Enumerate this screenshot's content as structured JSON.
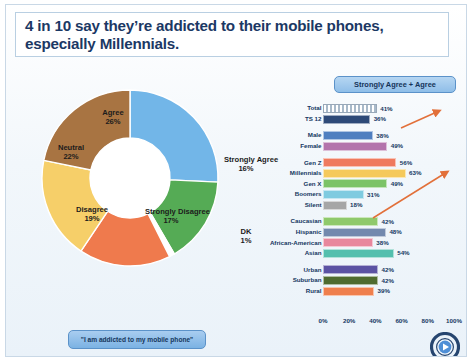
{
  "slide": {
    "title": "4 in 10 say they’re addicted to their mobile phones, especially Millennials.",
    "quote_caption": "\"I am addicted to my mobile phone\"",
    "legend_label": "Strongly Agree + Agree",
    "logo_name": "circular-play-button-logo"
  },
  "chart_data": [
    {
      "type": "pie",
      "title": "\"I am addicted to my mobile phone\"",
      "subtype": "donut",
      "labels": [
        "Agree",
        "Strongly Agree",
        "DK",
        "Strongly Disagree",
        "Disagree",
        "Neutral"
      ],
      "values": [
        26,
        16,
        1,
        17,
        19,
        22
      ],
      "value_labels": [
        "26%",
        "16%",
        "1%",
        "17%",
        "19%",
        "22%"
      ],
      "colors": [
        "#72b6e8",
        "#55ab55",
        "#ffffff",
        "#ef7a4d",
        "#f6cf69",
        "#a87442"
      ],
      "legend": "none"
    },
    {
      "type": "bar",
      "orientation": "horizontal",
      "title": "Strongly Agree + Agree",
      "xlabel": "",
      "ylabel": "",
      "xlim": [
        0,
        100
      ],
      "xticks": [
        "0%",
        "20%",
        "40%",
        "60%",
        "80%",
        "100%"
      ],
      "xtick_values": [
        0,
        20,
        40,
        60,
        80,
        100
      ],
      "grid": false,
      "groups": [
        {
          "rows": [
            {
              "label": "Total",
              "value": 41,
              "value_label": "41%",
              "color": "#cfd9e3",
              "pattern": "hatched"
            },
            {
              "label": "TS 12",
              "value": 36,
              "value_label": "36%",
              "color": "#2e4a78",
              "pattern": "solid"
            }
          ]
        },
        {
          "rows": [
            {
              "label": "Male",
              "value": 38,
              "value_label": "38%",
              "color": "#4f7fc0",
              "pattern": "solid"
            },
            {
              "label": "Female",
              "value": 49,
              "value_label": "49%",
              "color": "#b374ac",
              "pattern": "solid"
            }
          ]
        },
        {
          "rows": [
            {
              "label": "Gen Z",
              "value": 56,
              "value_label": "56%",
              "color": "#ef7a5e",
              "pattern": "solid"
            },
            {
              "label": "Millennials",
              "value": 63,
              "value_label": "63%",
              "color": "#f5c95b",
              "pattern": "solid"
            },
            {
              "label": "Gen X",
              "value": 49,
              "value_label": "49%",
              "color": "#7cc367",
              "pattern": "solid"
            },
            {
              "label": "Boomers",
              "value": 31,
              "value_label": "31%",
              "color": "#7fcbe0",
              "pattern": "solid"
            },
            {
              "label": "Silent",
              "value": 18,
              "value_label": "18%",
              "color": "#a6a6a6",
              "pattern": "solid"
            }
          ]
        },
        {
          "rows": [
            {
              "label": "Caucasian",
              "value": 42,
              "value_label": "42%",
              "color": "#8fc96b",
              "pattern": "solid"
            },
            {
              "label": "Hispanic",
              "value": 48,
              "value_label": "48%",
              "color": "#7389ae",
              "pattern": "solid"
            },
            {
              "label": "African-American",
              "value": 38,
              "value_label": "38%",
              "color": "#e8879d",
              "pattern": "solid"
            },
            {
              "label": "Asian",
              "value": 54,
              "value_label": "54%",
              "color": "#54bfae",
              "pattern": "solid"
            }
          ]
        },
        {
          "rows": [
            {
              "label": "Urban",
              "value": 42,
              "value_label": "42%",
              "color": "#5b52a3",
              "pattern": "solid"
            },
            {
              "label": "Suburban",
              "value": 42,
              "value_label": "42%",
              "color": "#4f6b2f",
              "pattern": "solid"
            },
            {
              "label": "Rural",
              "value": 39,
              "value_label": "39%",
              "color": "#ef7f4d",
              "pattern": "solid"
            }
          ]
        }
      ],
      "annotations": [
        {
          "name": "arrow-to-total",
          "color": "#e2703a"
        },
        {
          "name": "arrow-to-millennials",
          "color": "#e2703a"
        }
      ]
    }
  ]
}
